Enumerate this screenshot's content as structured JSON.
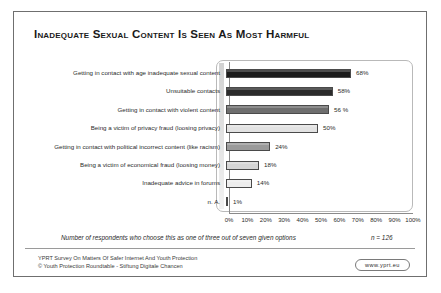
{
  "slide": {
    "title": "Inadequate Sexual Content Is Seen As Most Harmful",
    "footnote": "Number of respondents who choose this as one of three out of seven given options",
    "n_value": "n = 126",
    "source_line1": "YPRT Survey On Matters Of Safer Internet And Youth Protection",
    "source_line2": "© Youth Protection Roundtable - Stiftung Digitale Chancen",
    "logo_label": "www.yprt.eu"
  },
  "chart_data": {
    "type": "bar",
    "orientation": "horizontal",
    "title": "Inadequate Sexual Content Is Seen As Most Harmful",
    "xlabel": "",
    "ylabel": "",
    "xlim": [
      0,
      100
    ],
    "grid": false,
    "legend": "none",
    "categories": [
      "Getting in contact with age inadequate sexual content",
      "Unsuitable contacts",
      "Getting in contact with violent content",
      "Being a victim of privacy fraud (loosing privacy)",
      "Getting in contact with political incorrect content (like racism)",
      "Being a victim of economical fraud (loosing money)",
      "Inadequate advice in forums",
      "n. A."
    ],
    "values": [
      68,
      58,
      56,
      50,
      24,
      18,
      14,
      1
    ],
    "value_labels": [
      "68%",
      "58%",
      "56 %",
      "50%",
      "24%",
      "18%",
      "14%",
      "1%"
    ],
    "bar_colors": [
      "#1c1c1c",
      "#2b2b2b",
      "#6e6e6e",
      "#e2e2e2",
      "#9a9a9a",
      "#d5d5d5",
      "#ededed",
      "#4a4a4a"
    ],
    "tick_labels": [
      "0%",
      "10%",
      "20%",
      "30%",
      "40%",
      "50%",
      "60%",
      "70%",
      "80%",
      "90%",
      "100%"
    ],
    "tick_values": [
      0,
      10,
      20,
      30,
      40,
      50,
      60,
      70,
      80,
      90,
      100
    ],
    "annotation": "n = 126"
  }
}
